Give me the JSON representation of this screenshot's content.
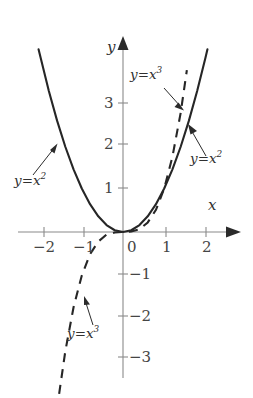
{
  "figure": {
    "background_color": "#ffffff",
    "curve_color": "#262626",
    "axis_color": "#8a8a8a",
    "label_color": "#303030"
  },
  "axes": {
    "x_name": "x",
    "y_name": "y",
    "x_ticks": [
      {
        "value": -2,
        "label": "−2",
        "px": 44
      },
      {
        "value": -1,
        "label": "−1",
        "px": 84
      },
      {
        "value": 0,
        "label": "0",
        "px": 123
      },
      {
        "value": 1,
        "label": "1",
        "px": 166
      },
      {
        "value": 2,
        "label": "2",
        "px": 206
      }
    ],
    "y_ticks": [
      {
        "value": 3,
        "label": "3",
        "px": 103
      },
      {
        "value": 2,
        "label": "2",
        "px": 144
      },
      {
        "value": 1,
        "label": "1",
        "px": 188
      },
      {
        "value": -1,
        "label": "−1",
        "px": 274
      },
      {
        "value": -2,
        "label": "−2",
        "px": 316
      },
      {
        "value": -3,
        "label": "−3",
        "px": 357
      }
    ],
    "origin_px": {
      "x": 123,
      "y": 232
    },
    "unit_px": {
      "x": 41.2,
      "y": 43.5
    },
    "xlim": [
      -2.4,
      2.5
    ],
    "ylim": [
      -3.6,
      4.2
    ]
  },
  "chart_data": {
    "type": "line",
    "title": "",
    "xlabel": "x",
    "ylabel": "y",
    "xlim": [
      -2.4,
      2.5
    ],
    "ylim": [
      -3.6,
      4.2
    ],
    "grid": false,
    "legend": "annotations",
    "series": [
      {
        "name": "y = x^2",
        "label": "y = x²",
        "style": "solid",
        "color": "#262626",
        "equation": "y = x^2",
        "x": [
          -2.05,
          -1.8,
          -1.6,
          -1.4,
          -1.2,
          -1.0,
          -0.8,
          -0.6,
          -0.4,
          -0.2,
          0.0,
          0.2,
          0.4,
          0.6,
          0.8,
          1.0,
          1.2,
          1.4,
          1.6,
          1.8,
          2.0,
          2.05
        ],
        "y": [
          4.2,
          3.24,
          2.56,
          1.96,
          1.44,
          1.0,
          0.64,
          0.36,
          0.16,
          0.04,
          0.0,
          0.04,
          0.16,
          0.36,
          0.64,
          1.0,
          1.44,
          1.96,
          2.56,
          3.24,
          4.0,
          4.2
        ]
      },
      {
        "name": "y = x^3",
        "label": "y = x³",
        "style": "dashed",
        "color": "#262626",
        "equation": "y = x^3",
        "x": [
          -1.55,
          -1.4,
          -1.2,
          -1.0,
          -0.8,
          -0.6,
          -0.4,
          -0.2,
          0.0,
          0.2,
          0.4,
          0.6,
          0.8,
          1.0,
          1.2,
          1.4,
          1.55
        ],
        "y": [
          -3.72,
          -2.74,
          -1.73,
          -1.0,
          -0.51,
          -0.22,
          -0.06,
          -0.01,
          0.0,
          0.01,
          0.06,
          0.22,
          0.51,
          1.0,
          1.73,
          2.74,
          3.72
        ]
      }
    ],
    "annotations": [
      {
        "id": "left-parabola",
        "text": "y = x²",
        "points_to": "y = x^2 left branch"
      },
      {
        "id": "right-parabola",
        "text": "y = x²",
        "points_to": "y = x^2 right branch"
      },
      {
        "id": "upper-cubic",
        "text": "y = x³",
        "points_to": "y = x^3 upper branch"
      },
      {
        "id": "lower-cubic",
        "text": "y = x³",
        "points_to": "y = x^3 lower branch"
      }
    ]
  },
  "labels": {
    "left_parabola": {
      "y": "y",
      "eq": "=",
      "x": "x",
      "exp": "2"
    },
    "right_parabola": {
      "y": "y",
      "eq": "=",
      "x": "x",
      "exp": "2"
    },
    "upper_cubic": {
      "y": "y",
      "eq": "=",
      "x": "x",
      "exp": "3"
    },
    "lower_cubic": {
      "y": "y",
      "eq": "=",
      "x": "x",
      "exp": "3"
    }
  }
}
